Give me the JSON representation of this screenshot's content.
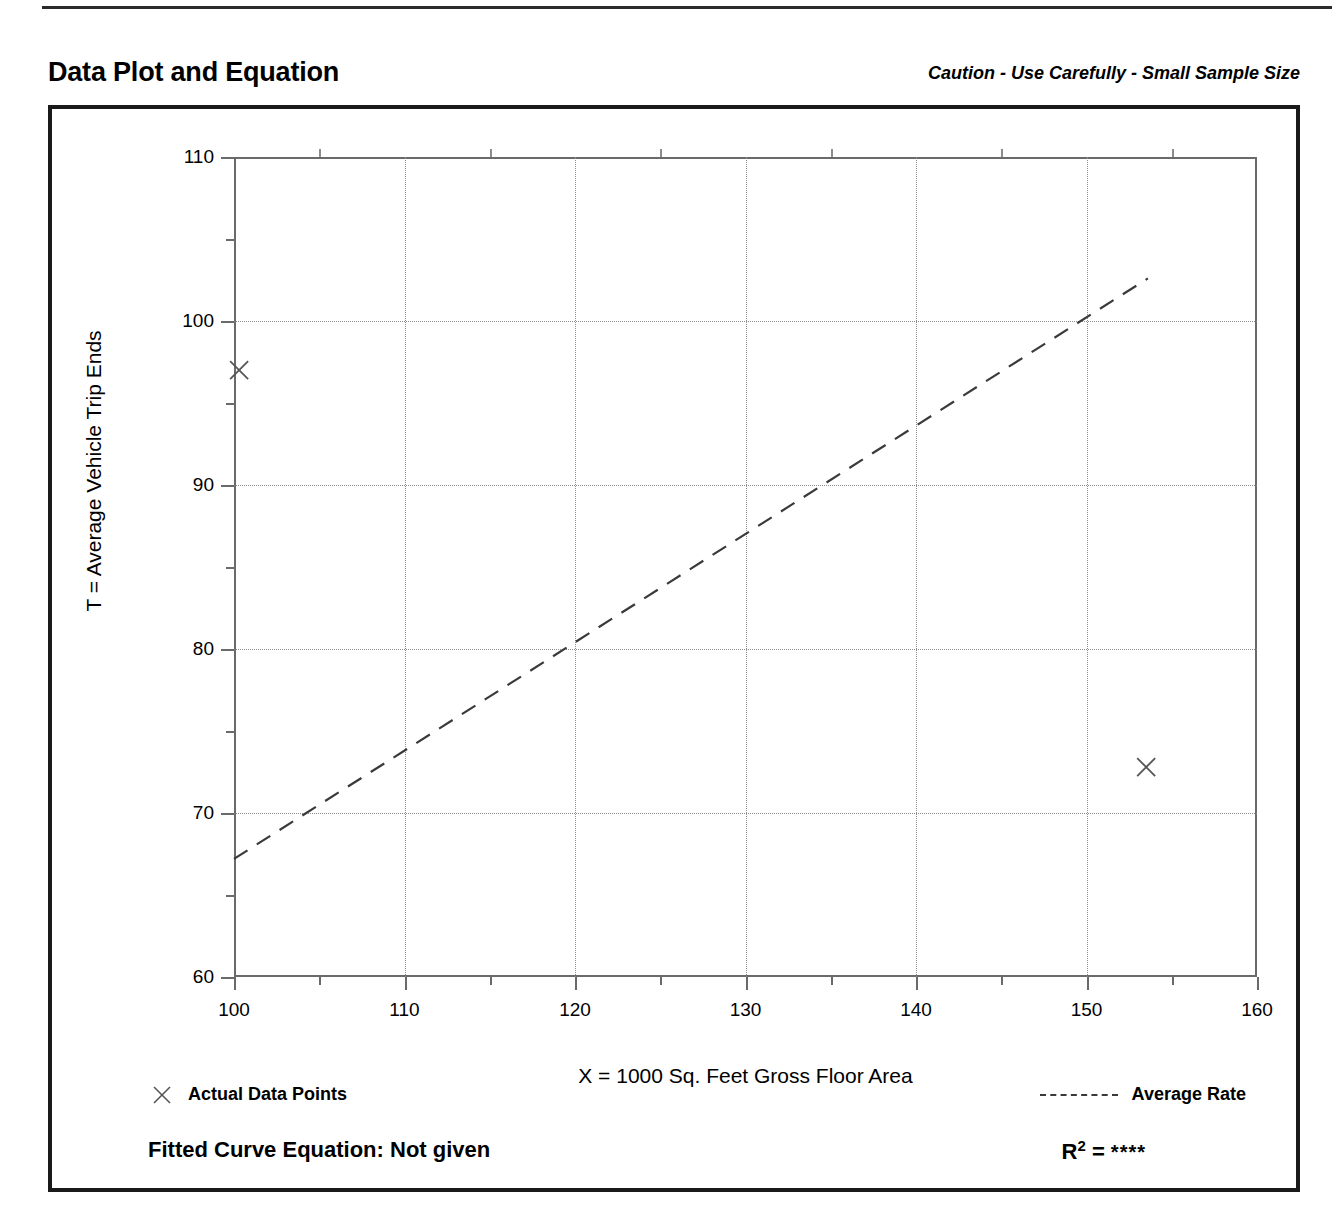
{
  "header": {
    "title": "Data Plot and Equation",
    "caution": "Caution - Use Carefully - Small Sample Size"
  },
  "footer": {
    "legend_points_label": "Actual Data Points",
    "legend_line_label": "Average Rate",
    "equation_label": "Fitted Curve Equation:  Not given",
    "r_squared_prefix": "R",
    "r_squared_exponent": "2",
    "r_squared_equals": " = ",
    "r_squared_value": "****"
  },
  "chart_data": {
    "type": "scatter",
    "title": "Data Plot and Equation",
    "xlabel": "X = 1000 Sq. Feet Gross Floor Area",
    "ylabel": "T = Average Vehicle Trip Ends",
    "xlim": [
      100,
      160
    ],
    "ylim": [
      60,
      110
    ],
    "xticks": [
      100,
      110,
      120,
      130,
      140,
      150,
      160
    ],
    "xticks_minor": [
      105,
      115,
      125,
      135,
      145,
      155
    ],
    "yticks": [
      60,
      70,
      80,
      90,
      100,
      110
    ],
    "yticks_minor": [
      65,
      75,
      85,
      95,
      105
    ],
    "grid": true,
    "legend_position": "below-plot",
    "series": [
      {
        "name": "Actual Data Points",
        "type": "scatter",
        "marker": "x",
        "color": "#555555",
        "points": [
          {
            "x": 100.3,
            "y": 97.0
          },
          {
            "x": 153.5,
            "y": 72.8
          }
        ]
      },
      {
        "name": "Average Rate",
        "type": "line",
        "style": "dashed",
        "color": "#3a3a3a",
        "points": [
          {
            "x": 100.0,
            "y": 67.2
          },
          {
            "x": 153.6,
            "y": 102.6
          }
        ]
      }
    ]
  }
}
